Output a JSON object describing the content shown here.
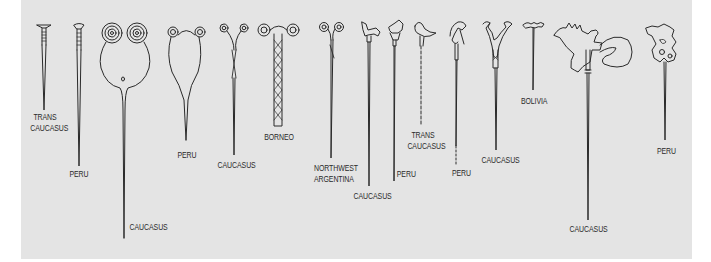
{
  "figure": {
    "background_color": "#e4e4e4",
    "ink_color": "#2a2a2a",
    "pins": [
      {
        "id": 1,
        "label_lines": [
          "TRANS",
          "CAUCASUS"
        ],
        "head": "nail-flat"
      },
      {
        "id": 2,
        "label_lines": [
          "PERU"
        ],
        "head": "nail-cup"
      },
      {
        "id": 3,
        "label_lines": [
          "CAUCASUS"
        ],
        "head": "double-spiral-loop"
      },
      {
        "id": 4,
        "label_lines": [
          "PERU"
        ],
        "head": "spiral-loop"
      },
      {
        "id": 5,
        "label_lines": [
          "CAUCASUS"
        ],
        "head": "spiral-twisted"
      },
      {
        "id": 6,
        "label_lines": [
          "BORNEO"
        ],
        "head": "spiral-braided"
      },
      {
        "id": 7,
        "label_lines": [
          "NORTHWEST",
          "ARGENTINA"
        ],
        "head": "spiral-small"
      },
      {
        "id": 8,
        "label_lines": [
          "CAUCASUS"
        ],
        "head": "animal-horse"
      },
      {
        "id": 9,
        "label_lines": [
          "PERU"
        ],
        "head": "animal-quadruped"
      },
      {
        "id": 10,
        "label_lines": [
          "TRANS",
          "CAUCASUS"
        ],
        "head": "bird"
      },
      {
        "id": 11,
        "label_lines": [
          "PERU"
        ],
        "head": "bird-beaked"
      },
      {
        "id": 12,
        "label_lines": [
          "CAUCASUS"
        ],
        "head": "forked-scroll"
      },
      {
        "id": 13,
        "label_lines": [
          "BOLIVIA"
        ],
        "head": "small-ornate"
      },
      {
        "id": 14,
        "label_lines": [
          "CAUCASUS"
        ],
        "head": "axe-antler"
      },
      {
        "id": 15,
        "label_lines": [
          "PERU"
        ],
        "head": "openwork-plaque"
      }
    ]
  }
}
